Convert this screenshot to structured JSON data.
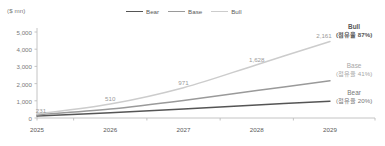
{
  "chart_data": {
    "type": "line",
    "title": "",
    "unit_label": "($ mn)",
    "xlabel": "",
    "ylabel": "",
    "x": [
      "2025",
      "2026",
      "2027",
      "2028",
      "2029"
    ],
    "categories": [
      "2025",
      "2026",
      "2027",
      "2028",
      "2029"
    ],
    "ylim": [
      0,
      5000
    ],
    "yticks": [
      "0",
      "1,000",
      "2,000",
      "3,000",
      "4,000",
      "5,000"
    ],
    "ytick_values": [
      0,
      1000,
      2000,
      3000,
      4000,
      5000
    ],
    "grid": false,
    "legend_position": "top-center",
    "series": [
      {
        "name": "Bear",
        "color": "#555555",
        "values": [
          120,
          300,
          520,
          760,
          980
        ]
      },
      {
        "name": "Base",
        "color": "#9a9a9a",
        "values": [
          180,
          520,
          1020,
          1600,
          2161
        ]
      },
      {
        "name": "Bull",
        "color": "#cccccc",
        "values": [
          231,
          810,
          1760,
          3100,
          4450
        ]
      }
    ],
    "point_labels": [
      {
        "text": "231",
        "series": "Bull",
        "x": "2025"
      },
      {
        "text": "510",
        "series": "Bull",
        "x": "2026"
      },
      {
        "text": "971",
        "series": "Bull",
        "x": "2027"
      },
      {
        "text": "1,628",
        "series": "Bull",
        "x": "2028"
      },
      {
        "text": "2,161",
        "series": "Bull",
        "x": "2029"
      }
    ],
    "annotations": [
      {
        "name": "Bull",
        "share": "(점유율 87%)"
      },
      {
        "name": "Base",
        "share": "(점유율 41%)"
      },
      {
        "name": "Bear",
        "share": "(점유율 20%)"
      }
    ]
  },
  "legend": {
    "items": [
      {
        "label": "Bear",
        "color": "#555555"
      },
      {
        "label": "Base",
        "color": "#9a9a9a"
      },
      {
        "label": "Bull",
        "color": "#cccccc"
      }
    ]
  }
}
